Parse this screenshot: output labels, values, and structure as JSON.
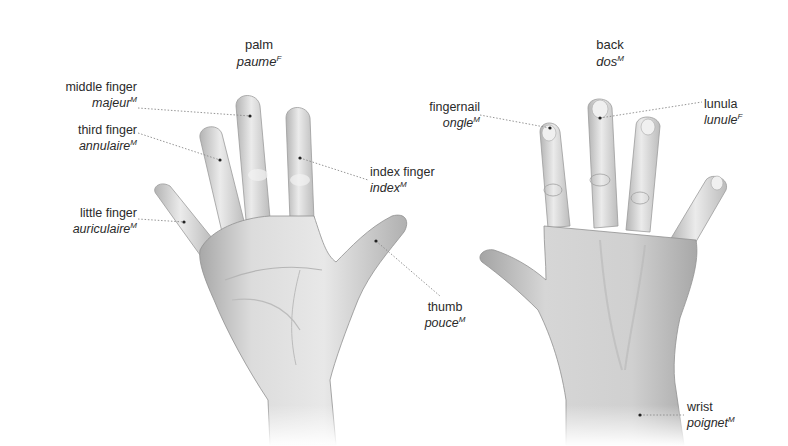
{
  "sections": {
    "palm": {
      "title": "palm",
      "fr": "paume",
      "gender": "F"
    },
    "back": {
      "title": "back",
      "fr": "dos",
      "gender": "M"
    }
  },
  "labels": {
    "middle_finger": {
      "en": "middle finger",
      "fr": "majeur",
      "gender": "M"
    },
    "third_finger": {
      "en": "third finger",
      "fr": "annulaire",
      "gender": "M"
    },
    "little_finger": {
      "en": "little finger",
      "fr": "auriculaire",
      "gender": "M"
    },
    "index_finger": {
      "en": "index finger",
      "fr": "index",
      "gender": "M"
    },
    "thumb": {
      "en": "thumb",
      "fr": "pouce",
      "gender": "M"
    },
    "fingernail": {
      "en": "fingernail",
      "fr": "ongle",
      "gender": "M"
    },
    "lunula": {
      "en": "lunula",
      "fr": "lunule",
      "gender": "F"
    },
    "wrist": {
      "en": "wrist",
      "fr": "poignet",
      "gender": "M"
    }
  },
  "colors": {
    "text": "#2a2a2a",
    "leader_line": "#8a8a8a",
    "skin_light": "#e6e6e6",
    "skin_mid": "#c9c9c9",
    "skin_dark": "#9a9a9a",
    "background": "#ffffff"
  }
}
